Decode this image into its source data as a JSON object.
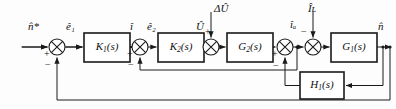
{
  "diagram": {
    "type": "control-system-block-diagram",
    "title": "",
    "width": 396,
    "height": 109,
    "line_color": "#1a1a1a",
    "block_fill": "#ffffff",
    "text_color": "#111111"
  },
  "blocks": [
    {
      "id": "K1",
      "label": "K",
      "sub": "1",
      "arg": "(s)",
      "full": "K1(s)",
      "x": 84,
      "y": 33,
      "w": 46,
      "h": 29
    },
    {
      "id": "K2",
      "label": "K",
      "sub": "2",
      "arg": "(s)",
      "full": "K2(s)",
      "x": 158,
      "y": 33,
      "w": 46,
      "h": 29
    },
    {
      "id": "G2",
      "label": "G",
      "sub": "2",
      "arg": "(s)",
      "full": "G2(s)",
      "x": 227,
      "y": 33,
      "w": 46,
      "h": 29
    },
    {
      "id": "G1",
      "label": "G",
      "sub": "1",
      "arg": "(s)",
      "full": "G1(s)",
      "x": 331,
      "y": 33,
      "w": 46,
      "h": 29
    },
    {
      "id": "H1",
      "label": "H",
      "sub": "1",
      "arg": "(s)",
      "full": "H1(s)",
      "x": 300,
      "y": 72,
      "w": 44,
      "h": 27
    }
  ],
  "summing_junctions": [
    {
      "id": "sum1",
      "cx": 57,
      "cy": 47,
      "r": 8,
      "inputs": [
        {
          "dir": "left",
          "sign": "+"
        },
        {
          "dir": "bottom",
          "sign": "−"
        }
      ]
    },
    {
      "id": "sum2",
      "cx": 140,
      "cy": 47,
      "r": 8,
      "inputs": [
        {
          "dir": "left",
          "sign": "+"
        },
        {
          "dir": "bottom",
          "sign": "−"
        }
      ]
    },
    {
      "id": "sum3",
      "cx": 211,
      "cy": 47,
      "r": 8,
      "inputs": [
        {
          "dir": "left",
          "sign": "+"
        },
        {
          "dir": "top",
          "sign": ""
        }
      ]
    },
    {
      "id": "sum4",
      "cx": 285,
      "cy": 47,
      "r": 8,
      "inputs": [
        {
          "dir": "left",
          "sign": "+"
        },
        {
          "dir": "bottom",
          "sign": "−"
        }
      ]
    },
    {
      "id": "sum5",
      "cx": 313,
      "cy": 47,
      "r": 8,
      "inputs": [
        {
          "dir": "left",
          "sign": "+"
        },
        {
          "dir": "top",
          "sign": "−"
        }
      ]
    }
  ],
  "signals": [
    {
      "id": "ref",
      "text": "n̂*",
      "base": "n",
      "sub": "",
      "star": "*",
      "x": 34,
      "y": 22
    },
    {
      "id": "e1",
      "text": "ê₁",
      "base": "e",
      "sub": "1",
      "star": "",
      "x": 68,
      "y": 22
    },
    {
      "id": "i",
      "text": "î",
      "base": "i",
      "sub": "",
      "star": "",
      "x": 132,
      "y": 22
    },
    {
      "id": "e2",
      "text": "ê₂",
      "base": "e",
      "sub": "2",
      "star": "",
      "x": 150,
      "y": 22
    },
    {
      "id": "U",
      "text": "Û",
      "base": "U",
      "sub": "",
      "star": "",
      "x": 200,
      "y": 22
    },
    {
      "id": "dU",
      "text": "ΔÛ",
      "base": "U",
      "sub": "",
      "star": "",
      "x": 215,
      "y": 4
    },
    {
      "id": "ia",
      "text": "îₐ",
      "base": "i",
      "sub": "a",
      "star": "",
      "x": 280,
      "y": 20
    },
    {
      "id": "IL",
      "text": "Îʟ",
      "base": "I",
      "sub": "L",
      "star": "",
      "x": 309,
      "y": 4
    },
    {
      "id": "nout",
      "text": "n̂",
      "base": "n",
      "sub": "",
      "star": "",
      "x": 381,
      "y": 22
    }
  ],
  "signs": [
    {
      "id": "sum1-plus",
      "text": "+",
      "x": 45,
      "y": 52
    },
    {
      "id": "sum1-minus",
      "text": "−",
      "x": 46,
      "y": 62
    },
    {
      "id": "sum2-plus",
      "text": "+",
      "x": 128,
      "y": 52
    },
    {
      "id": "sum2-minus",
      "text": "−",
      "x": 129,
      "y": 62
    },
    {
      "id": "sum3-plus",
      "text": "+",
      "x": 208,
      "y": 27
    },
    {
      "id": "sum4-plus",
      "text": "+",
      "x": 273,
      "y": 52
    },
    {
      "id": "sum4-minus",
      "text": "−",
      "x": 274,
      "y": 64
    },
    {
      "id": "sum5-minus",
      "text": "−",
      "x": 302,
      "y": 27
    }
  ],
  "paths": {
    "forward_y": 47,
    "inner_feedback_y": 70,
    "outer_feedback_y": 92,
    "h1_feedback_y": 85,
    "input_x": 22,
    "output_x": 392
  }
}
